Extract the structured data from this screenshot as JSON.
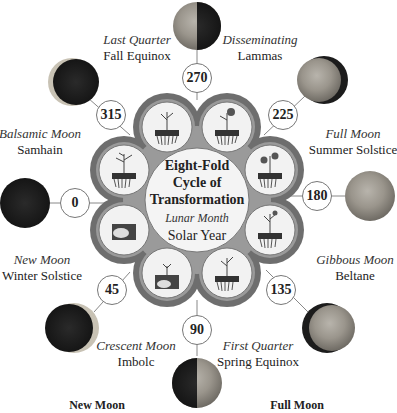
{
  "center": {
    "title_lines": [
      "Eight-Fold",
      "Cycle of",
      "Transformation"
    ],
    "subtitle_italic": "Lunar Month",
    "subtitle": "Solar Year"
  },
  "phases": [
    {
      "degree": "0",
      "moon": "New Moon",
      "festival": "Winter Solstice"
    },
    {
      "degree": "45",
      "moon": "Crescent Moon",
      "festival": "Imbolc"
    },
    {
      "degree": "90",
      "moon": "First Quarter",
      "festival": "Spring Equinox"
    },
    {
      "degree": "135",
      "moon": "Gibbous Moon",
      "festival": "Beltane"
    },
    {
      "degree": "180",
      "moon": "Full Moon",
      "festival": "Summer Solstice"
    },
    {
      "degree": "225",
      "moon": "Disseminating",
      "festival": "Lammas"
    },
    {
      "degree": "270",
      "moon": "Last Quarter",
      "festival": "Fall Equinox"
    },
    {
      "degree": "315",
      "moon": "Balsamic Moon",
      "festival": "Samhain"
    }
  ],
  "bottom_labels": {
    "left": "New Moon",
    "right": "Full Moon"
  },
  "colors": {
    "ring_dark": "#6e6e6e",
    "ring_light": "#9a9a9a",
    "lobe_fill": "#f2f2f2",
    "moon_dark": "#1c1c1c",
    "moon_light": "#9c9890"
  }
}
